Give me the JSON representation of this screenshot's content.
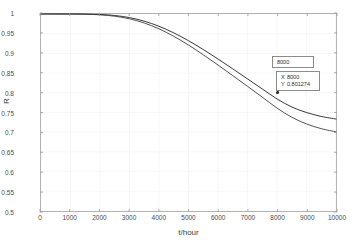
{
  "chart_data": {
    "type": "line",
    "title": "",
    "xlabel": "t/hour",
    "ylabel": "R",
    "xlim": [
      0,
      10000
    ],
    "ylim": [
      0.5,
      1.0
    ],
    "grid": true,
    "legend": null,
    "xticks": [
      0,
      1000,
      2000,
      3000,
      4000,
      5000,
      6000,
      7000,
      8000,
      9000,
      10000
    ],
    "xtick_labels": [
      "0",
      "1000",
      "2000",
      "3000",
      "4000",
      "5000",
      "6000",
      "7000",
      "8000",
      "9000",
      "10000"
    ],
    "yticks": [
      0.5,
      0.55,
      0.6,
      0.65,
      0.7,
      0.75,
      0.8,
      0.85,
      0.9,
      0.95,
      1
    ],
    "ytick_labels": [
      "0.5",
      "0.55",
      "0.6",
      "0.65",
      "0.7",
      "0.75",
      "0.8",
      "0.85",
      "0.9",
      "0.95",
      "1"
    ],
    "series": [
      {
        "name": "upper-curve",
        "color": "#1f1f1f",
        "x": [
          0,
          500,
          1000,
          1500,
          2000,
          2500,
          3000,
          3500,
          4000,
          4500,
          5000,
          5500,
          6000,
          6500,
          7000,
          7500,
          8000,
          8500,
          9000,
          9500,
          10000
        ],
        "values": [
          1.0,
          1.0,
          1.0,
          0.9997,
          0.9988,
          0.9962,
          0.9908,
          0.9818,
          0.9688,
          0.9521,
          0.9322,
          0.9098,
          0.8858,
          0.8608,
          0.8353,
          0.8098,
          0.7845,
          0.764,
          0.75,
          0.74,
          0.7335
        ]
      },
      {
        "name": "lower-curve",
        "color": "#3d3d3d",
        "x": [
          0,
          500,
          1000,
          1500,
          2000,
          2500,
          3000,
          3500,
          4000,
          4500,
          5000,
          5500,
          6000,
          6500,
          7000,
          7500,
          8000,
          8500,
          9000,
          9500,
          10000
        ],
        "values": [
          1.0,
          1.0,
          0.9999,
          0.9994,
          0.9979,
          0.9944,
          0.9878,
          0.9772,
          0.9623,
          0.9434,
          0.9212,
          0.8966,
          0.8705,
          0.8436,
          0.8164,
          0.789,
          0.7613,
          0.738,
          0.721,
          0.709,
          0.701
        ]
      }
    ],
    "annotations": [
      {
        "name": "data-tip",
        "title": "8000",
        "x_label": "X",
        "x_value": "8000",
        "y_label": "Y",
        "y_value": "0.801274",
        "marker_x": 8000,
        "marker_y": 0.801274,
        "attached_series": "lower-curve"
      }
    ]
  },
  "figure": {
    "background": "#ffffff",
    "axis_color": "#9a9a9a",
    "grid_color": "#f2f2f2"
  }
}
